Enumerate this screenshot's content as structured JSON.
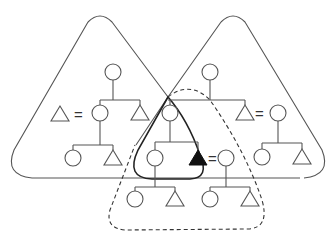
{
  "diagram": {
    "type": "kinship-diagram",
    "stroke_color": "#555555",
    "fill_color": "#111111",
    "equals_symbol": "=",
    "groups": [
      {
        "id": "left-household",
        "style": "solid",
        "shape": "rounded-triangle"
      },
      {
        "id": "right-household",
        "style": "solid",
        "shape": "rounded-triangle"
      },
      {
        "id": "ego-household",
        "style": "bold",
        "shape": "rounded-triangle"
      },
      {
        "id": "ego-descendants",
        "style": "dashed",
        "shape": "rounded-triangle"
      }
    ],
    "nodes": [
      {
        "id": "L-parent",
        "kind": "female"
      },
      {
        "id": "L-spouse",
        "kind": "male"
      },
      {
        "id": "L-daughter",
        "kind": "female"
      },
      {
        "id": "L-son",
        "kind": "male"
      },
      {
        "id": "L-grand-f",
        "kind": "female"
      },
      {
        "id": "L-grand-m",
        "kind": "male"
      },
      {
        "id": "R-parent",
        "kind": "female"
      },
      {
        "id": "R-son",
        "kind": "male"
      },
      {
        "id": "R-wife",
        "kind": "female"
      },
      {
        "id": "R-grand-f",
        "kind": "female"
      },
      {
        "id": "R-grand-m",
        "kind": "male"
      },
      {
        "id": "M-mother",
        "kind": "female"
      },
      {
        "id": "M-daughter",
        "kind": "female"
      },
      {
        "id": "ego",
        "kind": "male",
        "highlighted": true
      },
      {
        "id": "ego-wife",
        "kind": "female"
      },
      {
        "id": "B1-f",
        "kind": "female"
      },
      {
        "id": "B1-m",
        "kind": "male"
      },
      {
        "id": "B2-f",
        "kind": "female"
      },
      {
        "id": "B2-m",
        "kind": "male"
      }
    ]
  }
}
